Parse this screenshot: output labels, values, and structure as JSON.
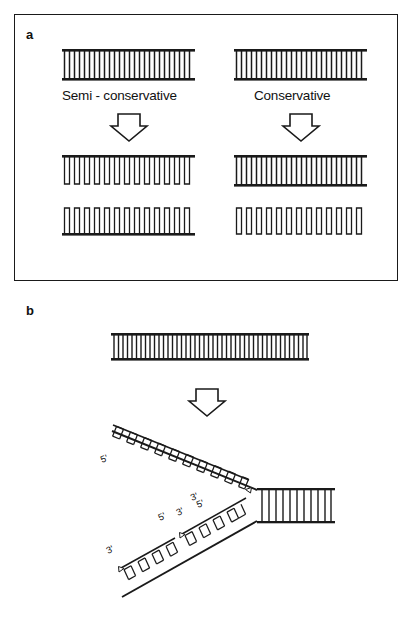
{
  "figure": {
    "type": "scientific-diagram",
    "background": "#ffffff",
    "ink_color": "#1a1a1a"
  },
  "panels": [
    {
      "id": "a",
      "label": "a",
      "caption_models": [
        "Semi - conservative",
        "Conservative"
      ],
      "description": "Two hypotheses for DNA replication shown as parent duplex ladders producing two daughter molecules each.",
      "columns": [
        {
          "name": "semi-conservative",
          "title": "Semi - conservative",
          "parent": {
            "name": "parent-duplex",
            "rungs": 26,
            "top_bar": "old",
            "bottom_bar": "old"
          },
          "arrow": "down-arrow",
          "daughters": [
            {
              "name": "daughter-1",
              "top_bar": "old",
              "bottom_bar": "new",
              "rungs": 26,
              "style": "half-old-half-new"
            },
            {
              "name": "daughter-2",
              "top_bar": "new",
              "bottom_bar": "old",
              "rungs": 26,
              "style": "half-old-half-new"
            }
          ]
        },
        {
          "name": "conservative",
          "title": "Conservative",
          "parent": {
            "name": "parent-duplex",
            "rungs": 26,
            "top_bar": "old",
            "bottom_bar": "old"
          },
          "arrow": "down-arrow",
          "daughters": [
            {
              "name": "daughter-1",
              "top_bar": "old",
              "bottom_bar": "old",
              "rungs": 26,
              "style": "all-old"
            },
            {
              "name": "daughter-2",
              "top_bar": "new",
              "bottom_bar": "new",
              "rungs": 26,
              "style": "all-new"
            }
          ]
        }
      ]
    },
    {
      "id": "b",
      "label": "b",
      "description": "A parent duplex opening into a replication fork with a continuous leading strand and a discontinuous lagging strand made of Okazaki fragments.",
      "parent": {
        "name": "parent-duplex",
        "rungs": 44
      },
      "arrow": "down-arrow",
      "fork": {
        "name": "replication-fork",
        "unreplicated_duplex": {
          "name": "unreplicated-duplex",
          "rungs": 11
        },
        "arms": [
          {
            "name": "leading-strand-arm",
            "position": "upper",
            "continuous": true,
            "fragments": [
              {
                "name": "leading-strand",
                "start_label": "5'",
                "end_label": "3'",
                "rungs": 20,
                "growth_marker": "triangle"
              }
            ]
          },
          {
            "name": "lagging-strand-arm",
            "position": "lower",
            "continuous": false,
            "fragments": [
              {
                "name": "okazaki-fragment-distal",
                "start_label": "3'",
                "end_label": "5'",
                "rungs": 9,
                "growth_marker": "triangle"
              },
              {
                "name": "okazaki-fragment-proximal",
                "start_label": "3'",
                "end_label": "5'",
                "rungs": 9,
                "growth_marker": "triangle"
              }
            ]
          }
        ]
      },
      "end_labels": {
        "leading_5_prime": "5'",
        "leading_3_prime": "3'",
        "template_5_prime": "5'",
        "lagging_distal_3_prime": "3'",
        "lagging_mid_5_prime": "5'",
        "lagging_mid_3_prime": "3'",
        "lagging_proximal_5_prime": "5'"
      }
    }
  ]
}
